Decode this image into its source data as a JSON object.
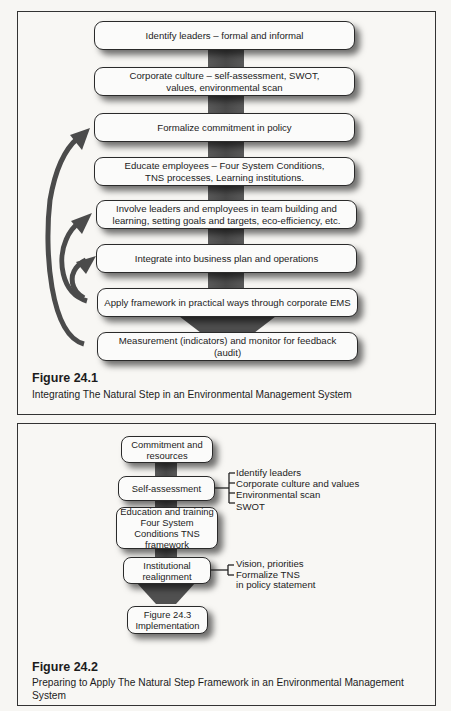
{
  "figure1": {
    "steps": [
      "Identify leaders – formal and informal",
      "Corporate culture – self-assessment, SWOT, values, environmental scan",
      "Formalize commitment in policy",
      "Educate employees – Four System Conditions, TNS processes, Learning institutions.",
      "Involve leaders and employees in team building and learning, setting goals and targets, eco-efficiency, etc.",
      "Integrate into business plan and operations",
      "Apply framework in practical ways through corporate EMS",
      "Measurement (indicators) and monitor for feedback (audit)"
    ],
    "feedback_arrows": [
      {
        "from": "Measurement (indicators) and monitor for feedback (audit)",
        "to": "Formalize commitment in policy"
      },
      {
        "from": "Apply framework in practical ways through corporate EMS",
        "to": "Involve leaders and employees in team building and learning, setting goals and targets, eco-efficiency, etc."
      },
      {
        "from": "Apply framework in practical ways through corporate EMS",
        "to": "Integrate into business plan and operations"
      }
    ],
    "caption_title": "Figure 24.1",
    "caption_text": "Integrating The Natural Step in an Environmental Management System"
  },
  "figure2": {
    "steps": [
      "Commitment and resources",
      "Self-assessment",
      "Education and training Four System Conditions TNS framework",
      "Institutional realignment",
      "Figure 24.3 Implementation"
    ],
    "self_assessment_items": [
      "Identify leaders",
      "Corporate culture and values",
      "Environmental scan",
      "SWOT"
    ],
    "realignment_items": [
      "Vision, priorities",
      "Formalize TNS",
      "in policy statement"
    ],
    "caption_title": "Figure 24.2",
    "caption_text": "Preparing to Apply The Natural Step Framework in an Environmental Management System"
  },
  "colors": {
    "arrow": "#4b4b4b",
    "spine": "#505050",
    "border": "#2a2a2a",
    "background": "#f8f7f4"
  }
}
